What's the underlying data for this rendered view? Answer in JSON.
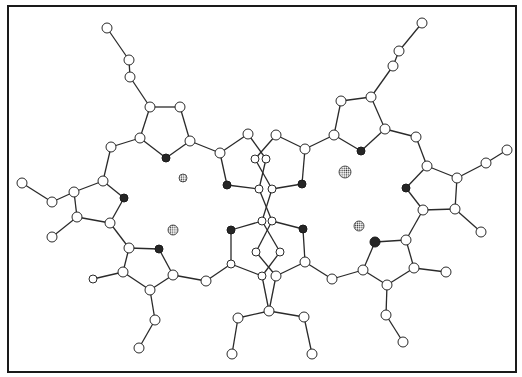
{
  "diagram": {
    "type": "molecular-ball-and-stick",
    "colors": {
      "carbon": "#ffffff",
      "nitrogen": "#262626",
      "metal": "#888888",
      "bond": "#2a2a2a",
      "frame": "#1a1a1a"
    },
    "frame": {
      "x": 8,
      "y": 6,
      "width": 508,
      "height": 366
    },
    "nodes": [
      {
        "id": "a1",
        "x": 107,
        "y": 28,
        "r": 5,
        "kind": "C"
      },
      {
        "id": "a2",
        "x": 129,
        "y": 60,
        "r": 5,
        "kind": "C"
      },
      {
        "id": "a3",
        "x": 130,
        "y": 77,
        "r": 5,
        "kind": "C"
      },
      {
        "id": "a4",
        "x": 150,
        "y": 107,
        "r": 5,
        "kind": "C"
      },
      {
        "id": "a5",
        "x": 180,
        "y": 107,
        "r": 5,
        "kind": "C"
      },
      {
        "id": "a6",
        "x": 190,
        "y": 141,
        "r": 5,
        "kind": "C"
      },
      {
        "id": "a7",
        "x": 166,
        "y": 158,
        "r": 4,
        "kind": "N"
      },
      {
        "id": "a8",
        "x": 140,
        "y": 138,
        "r": 5,
        "kind": "C"
      },
      {
        "id": "a9",
        "x": 111,
        "y": 147,
        "r": 5,
        "kind": "C"
      },
      {
        "id": "a10",
        "x": 103,
        "y": 181,
        "r": 5,
        "kind": "C"
      },
      {
        "id": "a11",
        "x": 124,
        "y": 198,
        "r": 4,
        "kind": "N"
      },
      {
        "id": "a12",
        "x": 110,
        "y": 223,
        "r": 5,
        "kind": "C"
      },
      {
        "id": "a13",
        "x": 77,
        "y": 217,
        "r": 5,
        "kind": "C"
      },
      {
        "id": "a14",
        "x": 74,
        "y": 192,
        "r": 5,
        "kind": "C"
      },
      {
        "id": "a15",
        "x": 52,
        "y": 202,
        "r": 5,
        "kind": "C"
      },
      {
        "id": "a16",
        "x": 22,
        "y": 183,
        "r": 5,
        "kind": "C"
      },
      {
        "id": "a17",
        "x": 52,
        "y": 237,
        "r": 5,
        "kind": "C"
      },
      {
        "id": "a18",
        "x": 129,
        "y": 248,
        "r": 5,
        "kind": "C"
      },
      {
        "id": "a19",
        "x": 159,
        "y": 249,
        "r": 4,
        "kind": "N"
      },
      {
        "id": "a20",
        "x": 173,
        "y": 275,
        "r": 5,
        "kind": "C"
      },
      {
        "id": "a21",
        "x": 150,
        "y": 290,
        "r": 5,
        "kind": "C"
      },
      {
        "id": "a22",
        "x": 123,
        "y": 272,
        "r": 5,
        "kind": "C"
      },
      {
        "id": "a23",
        "x": 93,
        "y": 279,
        "r": 4,
        "kind": "C"
      },
      {
        "id": "a24",
        "x": 155,
        "y": 320,
        "r": 5,
        "kind": "C"
      },
      {
        "id": "a25",
        "x": 139,
        "y": 348,
        "r": 5,
        "kind": "C"
      },
      {
        "id": "a26",
        "x": 206,
        "y": 281,
        "r": 5,
        "kind": "C"
      },
      {
        "id": "a27",
        "x": 220,
        "y": 153,
        "r": 5,
        "kind": "C"
      },
      {
        "id": "a28",
        "x": 248,
        "y": 134,
        "r": 5,
        "kind": "C"
      },
      {
        "id": "a29",
        "x": 227,
        "y": 185,
        "r": 4,
        "kind": "N"
      },
      {
        "id": "a30",
        "x": 255,
        "y": 159,
        "r": 4,
        "kind": "C"
      },
      {
        "id": "a31",
        "x": 266,
        "y": 159,
        "r": 4,
        "kind": "C"
      },
      {
        "id": "a32",
        "x": 259,
        "y": 189,
        "r": 4,
        "kind": "C"
      },
      {
        "id": "a33",
        "x": 272,
        "y": 189,
        "r": 4,
        "kind": "C"
      },
      {
        "id": "a34",
        "x": 276,
        "y": 135,
        "r": 5,
        "kind": "C"
      },
      {
        "id": "a35",
        "x": 305,
        "y": 149,
        "r": 5,
        "kind": "C"
      },
      {
        "id": "a36",
        "x": 302,
        "y": 184,
        "r": 4,
        "kind": "N"
      },
      {
        "id": "a37",
        "x": 231,
        "y": 230,
        "r": 4,
        "kind": "N"
      },
      {
        "id": "a38",
        "x": 262,
        "y": 221,
        "r": 4,
        "kind": "C"
      },
      {
        "id": "a39",
        "x": 272,
        "y": 221,
        "r": 4,
        "kind": "C"
      },
      {
        "id": "a40",
        "x": 303,
        "y": 229,
        "r": 4,
        "kind": "N"
      },
      {
        "id": "a41",
        "x": 256,
        "y": 252,
        "r": 4,
        "kind": "C"
      },
      {
        "id": "a42",
        "x": 280,
        "y": 252,
        "r": 4,
        "kind": "C"
      },
      {
        "id": "a43",
        "x": 231,
        "y": 264,
        "r": 4,
        "kind": "C"
      },
      {
        "id": "a44",
        "x": 305,
        "y": 262,
        "r": 5,
        "kind": "C"
      },
      {
        "id": "a45",
        "x": 262,
        "y": 276,
        "r": 4,
        "kind": "C"
      },
      {
        "id": "a46",
        "x": 276,
        "y": 276,
        "r": 5,
        "kind": "C"
      },
      {
        "id": "a47",
        "x": 269,
        "y": 311,
        "r": 5,
        "kind": "C"
      },
      {
        "id": "a48",
        "x": 238,
        "y": 318,
        "r": 5,
        "kind": "C"
      },
      {
        "id": "a49",
        "x": 232,
        "y": 354,
        "r": 5,
        "kind": "C"
      },
      {
        "id": "a50",
        "x": 304,
        "y": 317,
        "r": 5,
        "kind": "C"
      },
      {
        "id": "a51",
        "x": 312,
        "y": 354,
        "r": 5,
        "kind": "C"
      },
      {
        "id": "a52",
        "x": 332,
        "y": 279,
        "r": 5,
        "kind": "C"
      },
      {
        "id": "a53",
        "x": 334,
        "y": 135,
        "r": 5,
        "kind": "C"
      },
      {
        "id": "a54",
        "x": 341,
        "y": 101,
        "r": 5,
        "kind": "C"
      },
      {
        "id": "a55",
        "x": 371,
        "y": 97,
        "r": 5,
        "kind": "C"
      },
      {
        "id": "a56",
        "x": 385,
        "y": 129,
        "r": 5,
        "kind": "C"
      },
      {
        "id": "a57",
        "x": 361,
        "y": 151,
        "r": 4,
        "kind": "N"
      },
      {
        "id": "a58",
        "x": 393,
        "y": 66,
        "r": 5,
        "kind": "C"
      },
      {
        "id": "a59",
        "x": 399,
        "y": 51,
        "r": 5,
        "kind": "C"
      },
      {
        "id": "a60",
        "x": 422,
        "y": 23,
        "r": 5,
        "kind": "C"
      },
      {
        "id": "a61",
        "x": 416,
        "y": 137,
        "r": 5,
        "kind": "C"
      },
      {
        "id": "a62",
        "x": 427,
        "y": 166,
        "r": 5,
        "kind": "C"
      },
      {
        "id": "a63",
        "x": 406,
        "y": 188,
        "r": 4,
        "kind": "N"
      },
      {
        "id": "a64",
        "x": 423,
        "y": 210,
        "r": 5,
        "kind": "C"
      },
      {
        "id": "a65",
        "x": 455,
        "y": 209,
        "r": 5,
        "kind": "C"
      },
      {
        "id": "a66",
        "x": 457,
        "y": 178,
        "r": 5,
        "kind": "C"
      },
      {
        "id": "a67",
        "x": 486,
        "y": 163,
        "r": 5,
        "kind": "C"
      },
      {
        "id": "a68",
        "x": 507,
        "y": 150,
        "r": 5,
        "kind": "C"
      },
      {
        "id": "a69",
        "x": 481,
        "y": 232,
        "r": 5,
        "kind": "C"
      },
      {
        "id": "a70",
        "x": 406,
        "y": 240,
        "r": 5,
        "kind": "C"
      },
      {
        "id": "a71",
        "x": 375,
        "y": 242,
        "r": 5,
        "kind": "N"
      },
      {
        "id": "a72",
        "x": 363,
        "y": 270,
        "r": 5,
        "kind": "C"
      },
      {
        "id": "a73",
        "x": 387,
        "y": 285,
        "r": 5,
        "kind": "C"
      },
      {
        "id": "a74",
        "x": 414,
        "y": 268,
        "r": 5,
        "kind": "C"
      },
      {
        "id": "a75",
        "x": 446,
        "y": 272,
        "r": 5,
        "kind": "C"
      },
      {
        "id": "a76",
        "x": 386,
        "y": 315,
        "r": 5,
        "kind": "C"
      },
      {
        "id": "a77",
        "x": 403,
        "y": 342,
        "r": 5,
        "kind": "C"
      }
    ],
    "metals": [
      {
        "id": "m1",
        "x": 183,
        "y": 178,
        "r": 4
      },
      {
        "id": "m2",
        "x": 173,
        "y": 230,
        "r": 5
      },
      {
        "id": "m3",
        "x": 345,
        "y": 172,
        "r": 6
      },
      {
        "id": "m4",
        "x": 359,
        "y": 226,
        "r": 5
      }
    ],
    "bonds": [
      [
        "a1",
        "a2"
      ],
      [
        "a2",
        "a3"
      ],
      [
        "a3",
        "a4"
      ],
      [
        "a4",
        "a5"
      ],
      [
        "a5",
        "a6"
      ],
      [
        "a6",
        "a7"
      ],
      [
        "a7",
        "a8"
      ],
      [
        "a8",
        "a4"
      ],
      [
        "a8",
        "a9"
      ],
      [
        "a9",
        "a10"
      ],
      [
        "a10",
        "a11"
      ],
      [
        "a11",
        "a12"
      ],
      [
        "a12",
        "a13"
      ],
      [
        "a13",
        "a14"
      ],
      [
        "a14",
        "a10"
      ],
      [
        "a14",
        "a15"
      ],
      [
        "a15",
        "a16"
      ],
      [
        "a13",
        "a17"
      ],
      [
        "a12",
        "a18"
      ],
      [
        "a18",
        "a19"
      ],
      [
        "a19",
        "a20"
      ],
      [
        "a20",
        "a21"
      ],
      [
        "a21",
        "a22"
      ],
      [
        "a22",
        "a18"
      ],
      [
        "a22",
        "a23"
      ],
      [
        "a21",
        "a24"
      ],
      [
        "a24",
        "a25"
      ],
      [
        "a20",
        "a26"
      ],
      [
        "a26",
        "a43"
      ],
      [
        "a6",
        "a27"
      ],
      [
        "a27",
        "a28"
      ],
      [
        "a27",
        "a29"
      ],
      [
        "a29",
        "a32"
      ],
      [
        "a28",
        "a31"
      ],
      [
        "a31",
        "a32"
      ],
      [
        "a34",
        "a30"
      ],
      [
        "a30",
        "a33"
      ],
      [
        "a34",
        "a35"
      ],
      [
        "a35",
        "a36"
      ],
      [
        "a36",
        "a33"
      ],
      [
        "a35",
        "a53"
      ],
      [
        "a32",
        "a39"
      ],
      [
        "a33",
        "a38"
      ],
      [
        "a38",
        "a37"
      ],
      [
        "a39",
        "a40"
      ],
      [
        "a37",
        "a43"
      ],
      [
        "a40",
        "a44"
      ],
      [
        "a38",
        "a42"
      ],
      [
        "a39",
        "a41"
      ],
      [
        "a41",
        "a46"
      ],
      [
        "a42",
        "a45"
      ],
      [
        "a43",
        "a45"
      ],
      [
        "a44",
        "a46"
      ],
      [
        "a45",
        "a47"
      ],
      [
        "a46",
        "a47"
      ],
      [
        "a47",
        "a48"
      ],
      [
        "a48",
        "a49"
      ],
      [
        "a47",
        "a50"
      ],
      [
        "a50",
        "a51"
      ],
      [
        "a44",
        "a52"
      ],
      [
        "a52",
        "a72"
      ],
      [
        "a53",
        "a54"
      ],
      [
        "a54",
        "a55"
      ],
      [
        "a55",
        "a56"
      ],
      [
        "a56",
        "a57"
      ],
      [
        "a57",
        "a53"
      ],
      [
        "a55",
        "a58"
      ],
      [
        "a58",
        "a59"
      ],
      [
        "a59",
        "a60"
      ],
      [
        "a56",
        "a61"
      ],
      [
        "a61",
        "a62"
      ],
      [
        "a62",
        "a63"
      ],
      [
        "a63",
        "a64"
      ],
      [
        "a64",
        "a65"
      ],
      [
        "a65",
        "a66"
      ],
      [
        "a66",
        "a62"
      ],
      [
        "a66",
        "a67"
      ],
      [
        "a67",
        "a68"
      ],
      [
        "a65",
        "a69"
      ],
      [
        "a64",
        "a70"
      ],
      [
        "a70",
        "a71"
      ],
      [
        "a71",
        "a72"
      ],
      [
        "a72",
        "a73"
      ],
      [
        "a73",
        "a74"
      ],
      [
        "a74",
        "a70"
      ],
      [
        "a74",
        "a75"
      ],
      [
        "a73",
        "a76"
      ],
      [
        "a76",
        "a77"
      ]
    ]
  }
}
